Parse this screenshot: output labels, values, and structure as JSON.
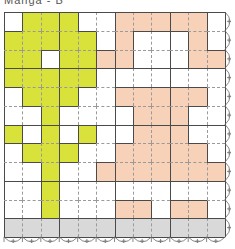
{
  "title": "Manga - B",
  "colors": {
    "green": "#d8e23a",
    "peach": "#f8d2b8",
    "gray": "#d9d9d9",
    "line": "#4a4a4a",
    "dash": "#9a9a9a",
    "white": "#ffffff"
  },
  "grid": {
    "cols": 12,
    "rows": 12,
    "cell_w": 18.42,
    "cell_h": 18.75,
    "cells": {
      "green": [
        [
          0,
          1
        ],
        [
          0,
          2
        ],
        [
          0,
          3
        ],
        [
          1,
          0
        ],
        [
          1,
          1
        ],
        [
          1,
          2
        ],
        [
          1,
          3
        ],
        [
          1,
          4
        ],
        [
          2,
          0
        ],
        [
          2,
          1
        ],
        [
          2,
          3
        ],
        [
          2,
          4
        ],
        [
          3,
          0
        ],
        [
          3,
          1
        ],
        [
          3,
          2
        ],
        [
          3,
          3
        ],
        [
          3,
          4
        ],
        [
          4,
          1
        ],
        [
          4,
          2
        ],
        [
          4,
          3
        ],
        [
          5,
          2
        ],
        [
          6,
          0
        ],
        [
          6,
          2
        ],
        [
          6,
          4
        ],
        [
          7,
          1
        ],
        [
          7,
          2
        ],
        [
          7,
          3
        ],
        [
          8,
          2
        ],
        [
          9,
          2
        ],
        [
          10,
          2
        ]
      ],
      "peach": [
        [
          0,
          6
        ],
        [
          0,
          7
        ],
        [
          0,
          8
        ],
        [
          0,
          9
        ],
        [
          0,
          10
        ],
        [
          1,
          6
        ],
        [
          1,
          10
        ],
        [
          2,
          5
        ],
        [
          2,
          6
        ],
        [
          2,
          10
        ],
        [
          2,
          11
        ],
        [
          4,
          6
        ],
        [
          4,
          7
        ],
        [
          4,
          8
        ],
        [
          4,
          9
        ],
        [
          4,
          10
        ],
        [
          5,
          7
        ],
        [
          5,
          8
        ],
        [
          5,
          9
        ],
        [
          6,
          7
        ],
        [
          6,
          8
        ],
        [
          6,
          9
        ],
        [
          7,
          6
        ],
        [
          7,
          7
        ],
        [
          7,
          8
        ],
        [
          7,
          9
        ],
        [
          7,
          10
        ],
        [
          8,
          5
        ],
        [
          8,
          6
        ],
        [
          8,
          7
        ],
        [
          8,
          8
        ],
        [
          8,
          9
        ],
        [
          8,
          10
        ],
        [
          8,
          11
        ],
        [
          10,
          6
        ],
        [
          10,
          7
        ],
        [
          10,
          9
        ],
        [
          10,
          10
        ]
      ],
      "gray_row": 11
    },
    "edge_decoration": {
      "right": "scalloped-arcs",
      "bottom": "scalloped-arcs-with-plus-marks"
    }
  }
}
